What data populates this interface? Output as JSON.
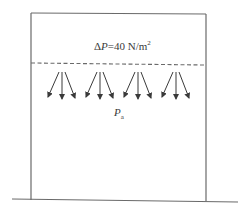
{
  "diagram": {
    "title": "",
    "pressure_label": {
      "delta_symbol": "Δ",
      "variable": "P",
      "equals_value": "=40 N/m",
      "exponent": "2",
      "full_text": "ΔP=40 N/m²"
    },
    "ambient_label": {
      "variable": "P",
      "subscript": "a",
      "full_text": "Pa"
    },
    "elements": {
      "container_box": "open-bottom rectangle enclosure",
      "dashed_line": "horizontal dashed boundary line",
      "arrow_groups": 4,
      "arrows_per_group": 3,
      "ground_line": "horizontal baseline"
    },
    "colors": {
      "stroke": "#6a6a6a",
      "text": "#3a3a3a",
      "background": "#ffffff"
    }
  }
}
